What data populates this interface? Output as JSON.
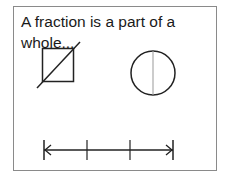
{
  "caption": "A fraction is a part of a whole...",
  "colors": {
    "stroke": "#222222",
    "divider": "#999999",
    "frame": "#8a8a8a"
  },
  "shapes": [
    {
      "type": "square",
      "divided_by": "diagonal line"
    },
    {
      "type": "circle",
      "divided_by": "vertical line"
    },
    {
      "type": "number_line",
      "ticks": 4,
      "arrows": "both ends"
    }
  ]
}
